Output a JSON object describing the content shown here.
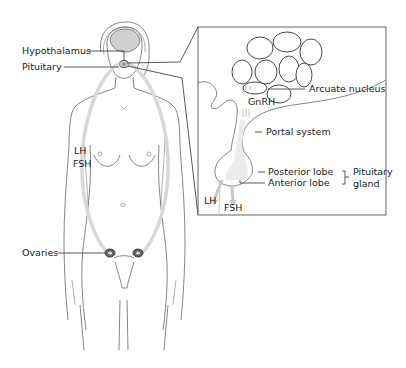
{
  "diagram": {
    "body_labels": {
      "hypothalamus": "Hypothalamus",
      "pituitary": "Pituitary",
      "lh": "LH",
      "fsh": "FSH",
      "ovaries": "Ovaries"
    },
    "inset_labels": {
      "arcuate_nucleus": "Arcuate nucleus",
      "gnrh": "GnRH",
      "portal_system": "Portal system",
      "posterior_lobe": "Posterior lobe",
      "anterior_lobe": "Anterior lobe",
      "pituitary_gland_line1": "Pituitary",
      "pituitary_gland_line2": "gland",
      "lh": "LH",
      "fsh": "FSH"
    },
    "colors": {
      "line": "#444444",
      "flow_arrow": "#d8d8d8",
      "background": "#ffffff"
    }
  }
}
